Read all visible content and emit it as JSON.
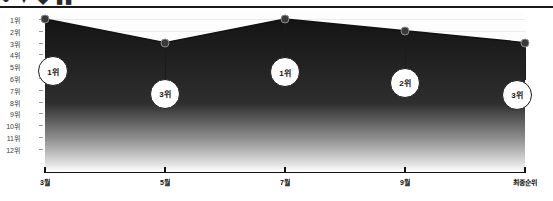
{
  "page": {
    "top_cut_text": "● ▼  ◆ ▮▮"
  },
  "chart_data": {
    "type": "area",
    "title": "",
    "subtitle": "",
    "xlabel": "",
    "ylabel": "",
    "grid": true,
    "legend": "none",
    "categories": [
      "3월",
      "5월",
      "7월",
      "9월",
      "최종순위"
    ],
    "x_tick_labels": [
      "3월",
      "5월",
      "7월",
      "9월",
      "최종순위"
    ],
    "y_tick_labels": [
      "1위",
      "2위",
      "3위",
      "4위",
      "5위",
      "6위",
      "7위",
      "8위",
      "9위",
      "10위",
      "11위",
      "12위"
    ],
    "y_values": [
      1,
      3,
      1,
      2,
      3
    ],
    "ylim": [
      1,
      12
    ],
    "y_inverted": true,
    "point_labels": [
      "1위",
      "3위",
      "1위",
      "2위",
      "3위"
    ],
    "series": [
      {
        "name": "순위",
        "values": [
          1,
          3,
          1,
          2,
          3
        ]
      }
    ],
    "colors": {
      "area_top": "#141414",
      "area_bottom": "#ffffff",
      "line": "#111111",
      "marker": "#3a3a3a",
      "axis": "#111111",
      "grid": "#ececec",
      "callout_bg": "#ffffff",
      "callout_border": "#1b1b1b",
      "text": "#111111"
    }
  }
}
